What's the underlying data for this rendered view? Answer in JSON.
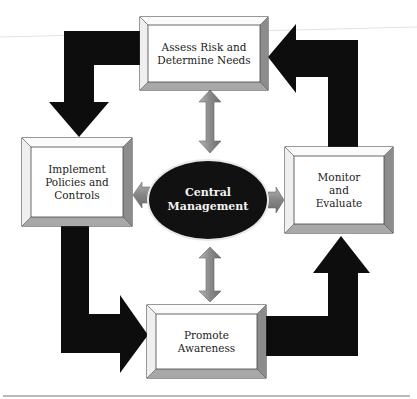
{
  "diagram": {
    "type": "cycle-with-hub",
    "center": {
      "label": "Central\nManagement",
      "shape": "ellipse",
      "fill": "#111111",
      "text_color": "#f4f4f4"
    },
    "nodes": [
      {
        "id": "assess",
        "label": "Assess Risk and\nDetermine Needs",
        "position": "top"
      },
      {
        "id": "implement",
        "label": "Implement\nPolicies and\nControls",
        "position": "left"
      },
      {
        "id": "promote",
        "label": "Promote\nAwareness",
        "position": "bottom"
      },
      {
        "id": "monitor",
        "label": "Monitor\nand\nEvaluate",
        "position": "right"
      }
    ],
    "cycle_edges": [
      {
        "from": "assess",
        "to": "implement",
        "style": "thick-black-elbow-arrow"
      },
      {
        "from": "implement",
        "to": "promote",
        "style": "thick-black-elbow-arrow"
      },
      {
        "from": "promote",
        "to": "monitor",
        "style": "thick-black-elbow-arrow"
      },
      {
        "from": "monitor",
        "to": "assess",
        "style": "thick-black-elbow-arrow"
      }
    ],
    "hub_edges": [
      {
        "between": [
          "center",
          "assess"
        ],
        "style": "gray-double-arrow"
      },
      {
        "between": [
          "center",
          "promote"
        ],
        "style": "gray-double-arrow"
      },
      {
        "from": "center",
        "to": "implement",
        "style": "gray-arrow"
      },
      {
        "from": "center",
        "to": "monitor",
        "style": "gray-arrow"
      }
    ],
    "colors": {
      "cycle_arrow": "#0d0d0d",
      "hub_arrow": "#8a8a8a",
      "box_face": "#ffffff",
      "bevel_light": "#f4f4f4",
      "bevel_right": "#8c8c8c",
      "bevel_bottom": "#a8a8a8",
      "outline": "#333333"
    }
  }
}
